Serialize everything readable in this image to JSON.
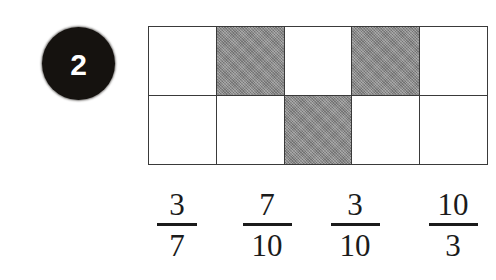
{
  "question": {
    "number": "2",
    "badge_color": "#15120f",
    "badge_text_color": "#ffffff"
  },
  "grid": {
    "rows": 2,
    "columns": 5,
    "total_cells": 10,
    "shaded_count": 3,
    "shaded_color": "#8a8a8a",
    "unshaded_color": "#ffffff",
    "border_color": "#3a3a3a",
    "cells": [
      [
        {
          "state": "unshaded"
        },
        {
          "state": "shaded"
        },
        {
          "state": "unshaded"
        },
        {
          "state": "shaded"
        },
        {
          "state": "unshaded"
        }
      ],
      [
        {
          "state": "unshaded"
        },
        {
          "state": "unshaded"
        },
        {
          "state": "shaded"
        },
        {
          "state": "unshaded"
        },
        {
          "state": "unshaded"
        }
      ]
    ]
  },
  "choices": [
    {
      "numerator": "3",
      "denominator": "7",
      "x": 34,
      "wide": false
    },
    {
      "numerator": "7",
      "denominator": "10",
      "x": 124,
      "wide": true
    },
    {
      "numerator": "3",
      "denominator": "10",
      "x": 212,
      "wide": true
    },
    {
      "numerator": "10",
      "denominator": "3",
      "x": 310,
      "wide": true
    }
  ]
}
